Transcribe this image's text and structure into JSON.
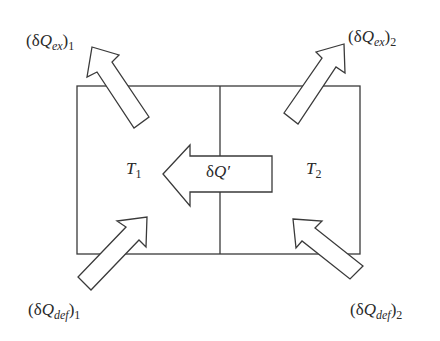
{
  "diagram": {
    "colors": {
      "stroke": "#3a3a3a",
      "fill": "#ffffff",
      "text": "#2a2a2a"
    },
    "regions": [
      {
        "id": "left",
        "temperature_symbol": "T",
        "temperature_subscript": "1"
      },
      {
        "id": "right",
        "temperature_symbol": "T",
        "temperature_subscript": "2"
      }
    ],
    "center_arrow": {
      "delta": "δ",
      "symbol": "Q",
      "prime": "′",
      "direction": "right-to-left"
    },
    "labels": {
      "ex1": {
        "open": "(δ",
        "symbol": "Q",
        "sub": "ex",
        "close": ")",
        "index": "1"
      },
      "ex2": {
        "open": "(δ",
        "symbol": "Q",
        "sub": "ex",
        "close": ")",
        "index": "2"
      },
      "def1": {
        "open": "(δ",
        "symbol": "Q",
        "sub": "def",
        "close": ")",
        "index": "1"
      },
      "def2": {
        "open": "(δ",
        "symbol": "Q",
        "sub": "def",
        "close": ")",
        "index": "2"
      }
    },
    "arrows": [
      {
        "name": "heat-exchange-1-arrow",
        "direction": "outward-up-left"
      },
      {
        "name": "heat-exchange-2-arrow",
        "direction": "outward-up-right"
      },
      {
        "name": "heat-deficit-1-arrow",
        "direction": "inward-up-right"
      },
      {
        "name": "heat-deficit-2-arrow",
        "direction": "inward-up-left"
      }
    ]
  }
}
